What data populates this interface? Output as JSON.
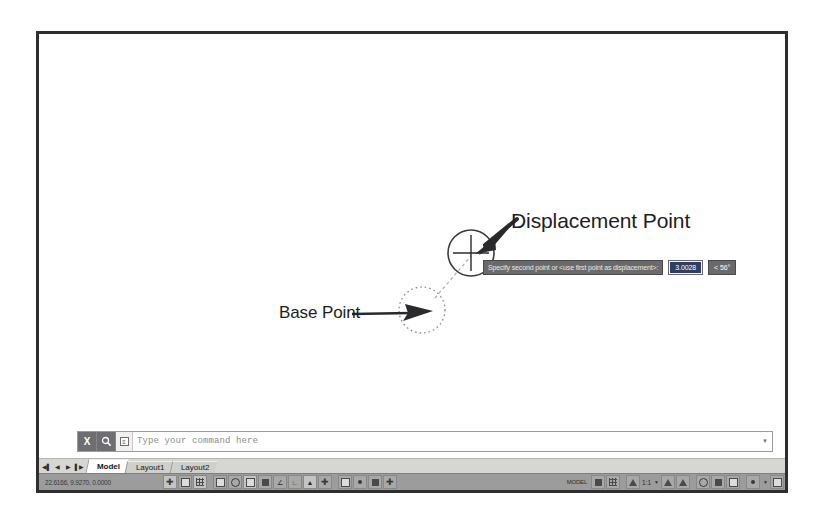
{
  "application": "AutoCAD",
  "annotations": {
    "displacement_label": "Displacement Point",
    "base_label": "Base Point"
  },
  "dynamic_input": {
    "prompt": "Specify second point or <use first point as displacement>:",
    "distance_value": "3.0028",
    "angle_value": "< 56°"
  },
  "command_line": {
    "close_label": "X",
    "search_icon": "magnifier-icon",
    "prefix_icon": "command-icon",
    "placeholder": "Type your command here",
    "dropdown_icon": "chevron-down-icon"
  },
  "layout_tabs": {
    "nav": {
      "first": "◀▌",
      "prev": "◀",
      "next": "▶",
      "last": "▌▶"
    },
    "tabs": [
      {
        "label": "Model",
        "active": true
      },
      {
        "label": "Layout1",
        "active": false
      },
      {
        "label": "Layout2",
        "active": false
      }
    ]
  },
  "status_bar": {
    "coordinates": "22.6166, 9.9270, 0.0000",
    "space_label": "MODEL",
    "annotation_scale": "1:1",
    "draft_toggles": [
      {
        "name": "snap-mode-toggle",
        "glyph": "plus",
        "on": true
      },
      {
        "name": "grid-display-toggle",
        "glyph": "grid2",
        "on": false
      },
      {
        "name": "grid-snap-toggle",
        "glyph": "grid",
        "on": true
      },
      {
        "name": "ortho-mode-toggle",
        "glyph": "ortho",
        "on": false
      },
      {
        "name": "polar-tracking-toggle",
        "glyph": "circ",
        "on": false
      },
      {
        "name": "object-snap-toggle",
        "glyph": "sq",
        "on": true
      },
      {
        "name": "3d-object-snap-toggle",
        "glyph": "sqf",
        "on": false
      },
      {
        "name": "object-snap-track-toggle",
        "glyph": "angle",
        "on": false
      },
      {
        "name": "otrack-toggle",
        "glyph": "lwt",
        "on": false
      },
      {
        "name": "dynamic-ucs-toggle",
        "glyph": "ucs",
        "on": false
      },
      {
        "name": "dynamic-input-toggle",
        "glyph": "dyn",
        "on": true
      },
      {
        "name": "lineweight-toggle",
        "glyph": "sq",
        "on": false
      },
      {
        "name": "transparency-toggle",
        "glyph": "tp",
        "on": false
      },
      {
        "name": "selection-cycling-toggle",
        "glyph": "cyc",
        "on": false
      },
      {
        "name": "annotation-monitor-toggle",
        "glyph": "plus",
        "on": false
      }
    ],
    "right_tools": [
      {
        "name": "workspace-switch-icon",
        "glyph": "sq"
      },
      {
        "name": "viewport-config-icon",
        "glyph": "sqf"
      },
      {
        "name": "visual-style-icon",
        "glyph": "grid"
      },
      {
        "name": "annotation-visibility-icon",
        "glyph": "tri"
      },
      {
        "name": "autoscale-icon",
        "glyph": "circ"
      },
      {
        "name": "isolate-objects-icon",
        "glyph": "sq"
      },
      {
        "name": "hardware-accel-icon",
        "glyph": "sqf"
      },
      {
        "name": "clean-screen-icon",
        "glyph": "sq"
      },
      {
        "name": "customization-icon",
        "glyph": "sqf"
      }
    ]
  }
}
